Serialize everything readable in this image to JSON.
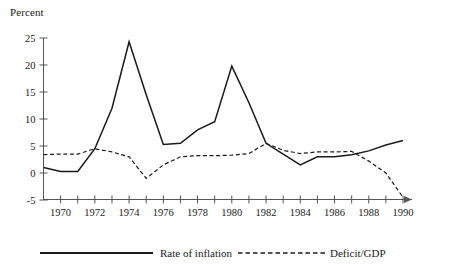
{
  "chart_data": {
    "type": "line",
    "title": "",
    "ylabel": "Percent",
    "xlabel": "",
    "ylim": [
      -5,
      25
    ],
    "xlim": [
      1969,
      1990
    ],
    "grid": false,
    "legend_position": "bottom",
    "yticks": [
      25,
      20,
      15,
      10,
      5,
      0,
      -5
    ],
    "xticks": [
      1970,
      1971,
      1972,
      1973,
      1974,
      1975,
      1976,
      1977,
      1978,
      1979,
      1980,
      1981,
      1982,
      1983,
      1984,
      1985,
      1986,
      1987,
      1988,
      1989,
      1990
    ],
    "xtick_labels": [
      "1970",
      "",
      "1972",
      "",
      "1974",
      "",
      "1976",
      "",
      "1978",
      "",
      "1980",
      "",
      "1982",
      "",
      "1984",
      "",
      "1986",
      "",
      "1988",
      "",
      "1990"
    ],
    "x": [
      1969,
      1970,
      1971,
      1972,
      1973,
      1974,
      1975,
      1976,
      1977,
      1978,
      1979,
      1980,
      1981,
      1982,
      1983,
      1984,
      1985,
      1986,
      1987,
      1988,
      1989,
      1990
    ],
    "series": [
      {
        "name": "Rate of inflation",
        "style": "solid",
        "color": "#1a1a1a",
        "values": [
          1.0,
          0.3,
          0.3,
          4.5,
          12.0,
          24.3,
          14.5,
          5.3,
          5.5,
          8.0,
          9.5,
          19.8,
          13.0,
          5.5,
          3.5,
          1.5,
          3.0,
          3.0,
          3.4,
          4.1,
          5.2,
          6.0
        ]
      },
      {
        "name": "Deficit/GDP",
        "style": "dashed",
        "color": "#1a1a1a",
        "values": [
          3.4,
          3.5,
          3.5,
          4.5,
          3.9,
          3.0,
          -1.0,
          1.5,
          3.0,
          3.2,
          3.2,
          3.3,
          3.6,
          5.5,
          4.2,
          3.6,
          3.9,
          3.9,
          4.0,
          2.2,
          0.0,
          -4.5
        ]
      }
    ]
  },
  "legend": {
    "items": [
      {
        "label": "Rate of inflation",
        "style": "solid"
      },
      {
        "label": "Deficit/GDP",
        "style": "dashed"
      }
    ]
  }
}
